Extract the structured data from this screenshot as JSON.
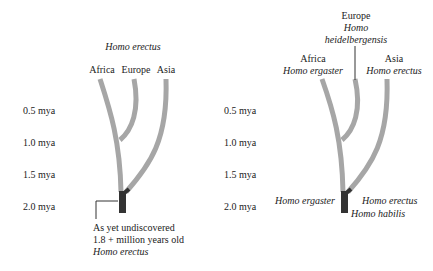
{
  "time_axis": [
    "0.5 mya",
    "1.0 mya",
    "1.5 mya",
    "2.0 mya"
  ],
  "left_tree": {
    "title": "Homo erectus",
    "tips": [
      "Africa",
      "Europe",
      "Asia"
    ],
    "root_note": [
      "As yet undiscovered",
      "1.8 + million years old",
      "Homo erectus"
    ]
  },
  "right_tree": {
    "tips": [
      {
        "region": "Africa",
        "species": "Homo ergaster"
      },
      {
        "region": "Europe",
        "species_line1": "Homo",
        "species_line2": "heidelbergensis"
      },
      {
        "region": "Asia",
        "species": "Homo erectus"
      }
    ],
    "root_left": "Homo ergaster",
    "root_right": "Homo erectus",
    "root_below": "Homo habilis"
  },
  "colors": {
    "branch": "#a6a6a6",
    "root": "#333333",
    "text": "#222222"
  }
}
